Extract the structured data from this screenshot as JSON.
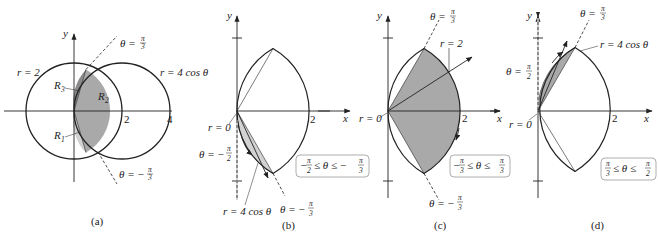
{
  "colors": {
    "ink": "#222222",
    "shade": "#a9a9a9",
    "shade_light": "#d2d2d2",
    "shade_dark": "#8a8a8a",
    "background": "#ffffff"
  },
  "panels": [
    {
      "id": "a",
      "caption": "(a)",
      "axis_x": "x",
      "axis_y": "y",
      "labels": {
        "circle": "r = 2",
        "cardioid": "r = 4 cos θ",
        "theta_top": "θ = π/3",
        "theta_bottom": "θ = −π/3",
        "region1": "R",
        "region1_sub": "1",
        "region2": "R",
        "region2_sub": "2",
        "region3": "R",
        "region3_sub": "3",
        "tick2": "2",
        "tick4": "4"
      }
    },
    {
      "id": "b",
      "caption": "(b)",
      "axis_x": "x",
      "axis_y": "y",
      "labels": {
        "r0": "r = 0",
        "theta_left": "θ = −",
        "theta_left_num": "π",
        "theta_left_den": "2",
        "theta_bottom": "θ = −",
        "theta_bottom_num": "π",
        "theta_bottom_den": "3",
        "curve": "r = 4 cos θ",
        "tick2": "2",
        "range": "−π/2 ≤ θ ≤ −π/3"
      }
    },
    {
      "id": "c",
      "caption": "(c)",
      "axis_x": "x",
      "axis_y": "y",
      "labels": {
        "theta_top": "θ =",
        "theta_top_num": "π",
        "theta_top_den": "3",
        "r2": "r = 2",
        "r0": "r = 0",
        "theta_bottom": "θ = −",
        "theta_bottom_num": "π",
        "theta_bottom_den": "3",
        "tick2": "2",
        "range": "−π/3 ≤ θ ≤ π/3"
      }
    },
    {
      "id": "d",
      "caption": "(d)",
      "axis_x": "x",
      "axis_y": "y",
      "labels": {
        "theta_top": "θ =",
        "theta_top_num": "π",
        "theta_top_den": "3",
        "theta_left": "θ =",
        "theta_left_num": "π",
        "theta_left_den": "2",
        "curve": "r = 4 cos θ",
        "r0": "r = 0",
        "tick2": "2",
        "range": "π/3 ≤ θ ≤ π/2"
      }
    }
  ]
}
